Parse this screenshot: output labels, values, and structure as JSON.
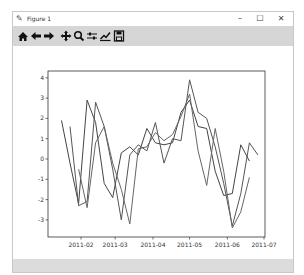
{
  "window": {
    "title": "Figure 1",
    "controls": {
      "minimize": "–",
      "maximize": "☐",
      "close": "✕"
    }
  },
  "toolbar": {
    "buttons": [
      {
        "name": "home",
        "icon": "home-icon"
      },
      {
        "name": "back",
        "icon": "arrow-left-icon"
      },
      {
        "name": "forward",
        "icon": "arrow-right-icon"
      },
      {
        "name": "pan",
        "icon": "move-icon"
      },
      {
        "name": "zoom",
        "icon": "zoom-icon"
      },
      {
        "name": "configure-subplots",
        "icon": "sliders-icon"
      },
      {
        "name": "edit-axis",
        "icon": "line-chart-icon"
      },
      {
        "name": "save",
        "icon": "save-icon"
      }
    ]
  },
  "colors": {
    "line": "#555555",
    "axis": "#333333",
    "toolbar": "#d6d6d6",
    "statusbar": "#dcdcdc"
  },
  "chart_data": {
    "type": "line",
    "title": "",
    "xlabel": "",
    "ylabel": "",
    "x_ticks": [
      "2011-02",
      "2011-03",
      "2011-04",
      "2011-05",
      "2011-06",
      "2011-07"
    ],
    "y_ticks": [
      -3,
      -2,
      -1,
      0,
      1,
      2,
      3,
      4
    ],
    "ylim": [
      -3.8,
      4.3
    ],
    "grid": false,
    "legend": null,
    "x": [
      "2011-01-16",
      "2011-01-23",
      "2011-01-30",
      "2011-02-06",
      "2011-02-13",
      "2011-02-20",
      "2011-02-27",
      "2011-03-06",
      "2011-03-13",
      "2011-03-20",
      "2011-03-27",
      "2011-04-03",
      "2011-04-10",
      "2011-04-17",
      "2011-04-24",
      "2011-05-01",
      "2011-05-08",
      "2011-05-15",
      "2011-05-22",
      "2011-05-29",
      "2011-06-05",
      "2011-06-12",
      "2011-06-19",
      "2011-06-26"
    ],
    "series": [
      {
        "name": "series-1",
        "values": [
          1.9,
          -0.2,
          -2.2,
          2.9,
          1.8,
          -1.2,
          -1.9,
          0.3,
          0.6,
          0.2,
          1.5,
          0.8,
          0.7,
          0.8,
          2.3,
          2.9,
          1.6,
          1.5,
          -0.6,
          -1.8,
          -1.7,
          0.7,
          -0.1,
          null
        ]
      },
      {
        "name": "series-2",
        "values": [
          null,
          1.6,
          -2.3,
          -2.1,
          2.8,
          1.6,
          -0.5,
          -3.0,
          0.2,
          0.7,
          0.4,
          1.8,
          -0.2,
          1.0,
          0.9,
          3.9,
          2.3,
          2.0,
          0.6,
          -1.2,
          -3.3,
          -1.7,
          0.8,
          0.2
        ]
      },
      {
        "name": "series-3",
        "values": [
          null,
          null,
          -0.5,
          -2.4,
          0.8,
          1.6,
          -0.2,
          -1.5,
          -3.2,
          0.5,
          0.6,
          1.3,
          0.9,
          1.2,
          2.1,
          3.2,
          0.4,
          -1.3,
          1.5,
          -0.6,
          -3.4,
          -2.6,
          -0.9,
          null
        ]
      }
    ]
  }
}
